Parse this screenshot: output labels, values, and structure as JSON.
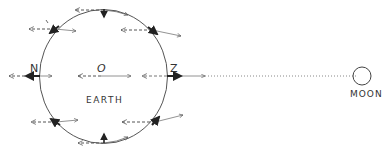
{
  "diagram": {
    "title": "",
    "labels": {
      "north": "N",
      "center": "O",
      "z_point": "Z",
      "earth": "EARTH",
      "moon": "MOON"
    },
    "colors": {
      "line": "#555555",
      "bold": "#222222",
      "background": "#ffffff"
    },
    "earth": {
      "cx": 103.5,
      "cy": 76.5,
      "rx": 64,
      "ry": 67
    },
    "moon": {
      "cx": 362,
      "cy": 76,
      "r": 9
    },
    "points": [
      {
        "id": "N",
        "x": 40,
        "y": 76
      },
      {
        "id": "O",
        "x": 101,
        "y": 76
      },
      {
        "id": "Z",
        "x": 167,
        "y": 76
      },
      {
        "id": "top",
        "x": 104,
        "y": 10
      },
      {
        "id": "bottom",
        "x": 104,
        "y": 143
      },
      {
        "id": "upper-left",
        "x": 55,
        "y": 29
      },
      {
        "id": "upper-right",
        "x": 152,
        "y": 30
      },
      {
        "id": "lower-left",
        "x": 56,
        "y": 122
      },
      {
        "id": "lower-right",
        "x": 155,
        "y": 122
      }
    ],
    "legend_note": "Dashed arrows point away from Moon (uniform component); thin solid arrows point toward Moon (local attraction); bold arrows show resulting tidal force."
  }
}
